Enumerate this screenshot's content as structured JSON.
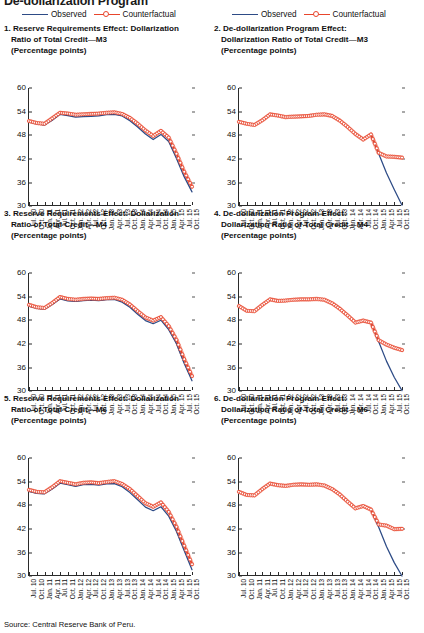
{
  "figure": {
    "heading": "De-dollarization Program",
    "source": "Source: Central Reserve Bank of Peru."
  },
  "legend": {
    "observed_label": "Observed",
    "counterfactual_label": "Counterfactual",
    "observed_color": "#2d4b86",
    "counterfactual_color": "#e8452c"
  },
  "panels": [
    {
      "number": "1.",
      "title_line1": "Reserve Requirements Effect: Dollarization",
      "title_line2": "Ratio of Total Credit—M3",
      "title_line3": "(Percentage points)"
    },
    {
      "number": "2.",
      "title_line1": "De-dollarization Program Effect:",
      "title_line2": "Dollarization Ratio of Total Credit—M3",
      "title_line3": "(Percentage points)"
    },
    {
      "number": "3.",
      "title_line1": "Reserve Requirements Effect: Dollarization",
      "title_line2": "Ratio of Total Credit—M4",
      "title_line3": "(Percentage points)"
    },
    {
      "number": "4.",
      "title_line1": "De-dollarization Program Effect:",
      "title_line2": "Dollarization Ratio of Total Credit—M4",
      "title_line3": "(Percentage points)"
    },
    {
      "number": "5.",
      "title_line1": "Reserve Requirements Effect: Dollarization",
      "title_line2": "Ratio of Total Credit—M6",
      "title_line3": "(Percentage points)"
    },
    {
      "number": "6.",
      "title_line1": "De-dollarization Program Effect:",
      "title_line2": "Dollarization Ratio of Total Credit—M6",
      "title_line3": "(Percentage points)"
    }
  ],
  "chart_data": [
    {
      "id": "panel-1",
      "type": "line",
      "title": "1. Reserve Requirements Effect: Dollarization Ratio of Total Credit—M3",
      "subtitle": "(Percentage points)",
      "xlabel": "",
      "ylabel": "Percentage points",
      "ylim": [
        30,
        60
      ],
      "yticks": [
        30,
        36,
        42,
        48,
        54,
        60
      ],
      "grid": false,
      "legend_position": "above-panel",
      "x": [
        "Jul. 10",
        "Oct. 10",
        "Jan. 11",
        "Apr. 11",
        "Jul. 11",
        "Oct. 11",
        "Jan. 12",
        "Apr. 12",
        "Jul. 12",
        "Oct. 12",
        "Jan. 13",
        "Apr. 13",
        "Jul. 13",
        "Oct. 13",
        "Jan. 14",
        "Apr. 14",
        "Jul. 14",
        "Oct. 14",
        "Jan. 15",
        "Apr. 15",
        "Jul. 15",
        "Oct. 15"
      ],
      "series": [
        {
          "name": "Observed",
          "color": "#2d4b86",
          "values": [
            51.4,
            50.9,
            50.6,
            51.8,
            53.3,
            53.0,
            52.6,
            52.7,
            52.8,
            52.9,
            53.2,
            53.3,
            52.9,
            51.7,
            50.1,
            48.3,
            46.9,
            48.2,
            46.4,
            42.1,
            37.4,
            33.6
          ]
        },
        {
          "name": "Counterfactual",
          "color": "#e8452c",
          "values": [
            51.6,
            51.1,
            50.9,
            52.3,
            53.7,
            53.5,
            53.2,
            53.3,
            53.4,
            53.5,
            53.7,
            53.8,
            53.4,
            52.4,
            50.9,
            49.2,
            47.8,
            49.1,
            47.4,
            43.3,
            38.7,
            34.9
          ]
        }
      ]
    },
    {
      "id": "panel-2",
      "type": "line",
      "title": "2. De-dollarization Program Effect: Dollarization Ratio of Total Credit—M3",
      "subtitle": "(Percentage points)",
      "xlabel": "",
      "ylabel": "Percentage points",
      "ylim": [
        30,
        60
      ],
      "yticks": [
        30,
        36,
        42,
        48,
        54,
        60
      ],
      "grid": false,
      "legend_position": "above-panel",
      "x": [
        "Jul. 10",
        "Oct. 10",
        "Jan. 11",
        "Apr. 11",
        "Jul. 11",
        "Oct. 11",
        "Jan. 12",
        "Apr. 12",
        "Jul. 12",
        "Oct. 12",
        "Jan. 13",
        "Apr. 13",
        "Jul. 13",
        "Oct. 13",
        "Jan. 14",
        "Apr. 14",
        "Jul. 14",
        "Oct. 14",
        "Jan. 15",
        "Apr. 15",
        "Jul. 15",
        "Oct. 15"
      ],
      "series": [
        {
          "name": "Observed",
          "color": "#2d4b86",
          "values": [
            51.4,
            50.9,
            50.6,
            51.8,
            53.3,
            53.0,
            52.6,
            52.7,
            52.8,
            52.9,
            53.2,
            53.3,
            52.9,
            51.7,
            50.1,
            48.3,
            46.9,
            48.2,
            43.3,
            38.4,
            34.2,
            30.2
          ]
        },
        {
          "name": "Counterfactual",
          "color": "#e8452c",
          "values": [
            51.4,
            50.9,
            50.6,
            51.8,
            53.3,
            53.0,
            52.6,
            52.7,
            52.8,
            52.9,
            53.2,
            53.3,
            52.9,
            51.7,
            50.1,
            48.3,
            46.9,
            48.2,
            43.5,
            42.6,
            42.5,
            42.3
          ]
        }
      ]
    },
    {
      "id": "panel-3",
      "type": "line",
      "title": "3. Reserve Requirements Effect: Dollarization Ratio of Total Credit—M4",
      "subtitle": "(Percentage points)",
      "xlabel": "",
      "ylabel": "Percentage points",
      "ylim": [
        30,
        60
      ],
      "yticks": [
        30,
        36,
        42,
        48,
        54,
        60
      ],
      "grid": false,
      "legend_position": "above-panel",
      "x": [
        "Jul. 10",
        "Oct. 10",
        "Jan. 11",
        "Apr. 11",
        "Jul. 11",
        "Oct. 11",
        "Jan. 12",
        "Apr. 12",
        "Jul. 12",
        "Oct. 12",
        "Jan. 13",
        "Apr. 13",
        "Jul. 13",
        "Oct. 13",
        "Jan. 14",
        "Apr. 14",
        "Jul. 14",
        "Oct. 14",
        "Jan. 15",
        "Apr. 15",
        "Jul. 15",
        "Oct. 15"
      ],
      "series": [
        {
          "name": "Observed",
          "color": "#2d4b86",
          "values": [
            51.6,
            51.0,
            50.8,
            52.0,
            53.4,
            52.9,
            52.8,
            53.0,
            53.1,
            53.0,
            53.2,
            53.3,
            52.6,
            51.3,
            49.5,
            47.9,
            47.1,
            48.0,
            45.6,
            42.0,
            37.0,
            32.6
          ]
        },
        {
          "name": "Counterfactual",
          "color": "#e8452c",
          "values": [
            51.9,
            51.3,
            51.1,
            52.4,
            53.9,
            53.4,
            53.2,
            53.4,
            53.5,
            53.4,
            53.6,
            53.7,
            53.2,
            52.0,
            50.3,
            48.7,
            47.9,
            48.8,
            46.5,
            43.0,
            38.1,
            33.8
          ]
        }
      ]
    },
    {
      "id": "panel-4",
      "type": "line",
      "title": "4. De-dollarization Program Effect: Dollarization Ratio of Total Credit—M4",
      "subtitle": "(Percentage points)",
      "xlabel": "",
      "ylabel": "Percentage points",
      "ylim": [
        30,
        60
      ],
      "yticks": [
        30,
        36,
        42,
        48,
        54,
        60
      ],
      "grid": false,
      "legend_position": "above-panel",
      "x": [
        "Jul. 10",
        "Oct. 10",
        "Jan. 11",
        "Apr. 11",
        "Jul. 11",
        "Oct. 11",
        "Jan. 12",
        "Apr. 12",
        "Jul. 12",
        "Oct. 12",
        "Jan. 13",
        "Apr. 13",
        "Jul. 13",
        "Oct. 13",
        "Jan. 14",
        "Apr. 14",
        "Jul. 14",
        "Oct. 14",
        "Jan. 15",
        "Apr. 15",
        "Jul. 15",
        "Oct. 15"
      ],
      "series": [
        {
          "name": "Observed",
          "color": "#2d4b86",
          "values": [
            51.6,
            50.4,
            50.3,
            51.9,
            53.3,
            52.9,
            53.0,
            53.2,
            53.3,
            53.3,
            53.4,
            53.2,
            52.3,
            50.9,
            49.2,
            47.4,
            47.9,
            47.4,
            42.5,
            37.6,
            33.5,
            30.1
          ]
        },
        {
          "name": "Counterfactual",
          "color": "#e8452c",
          "values": [
            51.6,
            50.4,
            50.3,
            51.9,
            53.3,
            52.9,
            53.0,
            53.2,
            53.3,
            53.3,
            53.4,
            53.2,
            52.3,
            50.9,
            49.2,
            47.4,
            47.9,
            47.4,
            42.9,
            41.8,
            41.0,
            40.4
          ]
        }
      ]
    },
    {
      "id": "panel-5",
      "type": "line",
      "title": "5. Reserve Requirements Effect: Dollarization Ratio of Total Credit—M6",
      "subtitle": "(Percentage points)",
      "xlabel": "",
      "ylabel": "Percentage points",
      "ylim": [
        30,
        60
      ],
      "yticks": [
        30,
        36,
        42,
        48,
        54,
        60
      ],
      "grid": false,
      "legend_position": "above-panel",
      "x": [
        "Jul. 10",
        "Oct. 10",
        "Jan. 11",
        "Apr. 11",
        "Jul. 11",
        "Oct. 11",
        "Jan. 12",
        "Apr. 12",
        "Jul. 12",
        "Oct. 12",
        "Jan. 13",
        "Apr. 13",
        "Jul. 13",
        "Oct. 13",
        "Jan. 14",
        "Apr. 14",
        "Jul. 14",
        "Oct. 14",
        "Jan. 15",
        "Apr. 15",
        "Jul. 15",
        "Oct. 15"
      ],
      "series": [
        {
          "name": "Observed",
          "color": "#2d4b86",
          "values": [
            51.5,
            51.0,
            50.9,
            52.1,
            53.6,
            53.2,
            52.8,
            53.2,
            53.3,
            53.1,
            53.4,
            53.5,
            52.7,
            51.2,
            49.4,
            47.5,
            46.6,
            47.6,
            45.2,
            41.3,
            36.4,
            31.6
          ]
        },
        {
          "name": "Counterfactual",
          "color": "#e8452c",
          "values": [
            51.9,
            51.4,
            51.3,
            52.6,
            54.1,
            53.7,
            53.3,
            53.7,
            53.8,
            53.6,
            53.9,
            54.1,
            53.4,
            52.1,
            50.3,
            48.5,
            47.6,
            48.7,
            46.3,
            42.5,
            37.7,
            33.0
          ]
        }
      ]
    },
    {
      "id": "panel-6",
      "type": "line",
      "title": "6. De-dollarization Program Effect: Dollarization Ratio of Total Credit—M6",
      "subtitle": "(Percentage points)",
      "xlabel": "",
      "ylabel": "Percentage points",
      "ylim": [
        30,
        60
      ],
      "yticks": [
        30,
        36,
        42,
        48,
        54,
        60
      ],
      "grid": false,
      "legend_position": "above-panel",
      "x": [
        "Jul. 10",
        "Oct. 10",
        "Jan. 11",
        "Apr. 11",
        "Jul. 11",
        "Oct. 11",
        "Jan. 12",
        "Apr. 12",
        "Jul. 12",
        "Oct. 12",
        "Jan. 13",
        "Apr. 13",
        "Jul. 13",
        "Oct. 13",
        "Jan. 14",
        "Apr. 14",
        "Jul. 14",
        "Oct. 14",
        "Jan. 15",
        "Apr. 15",
        "Jul. 15",
        "Oct. 15"
      ],
      "series": [
        {
          "name": "Observed",
          "color": "#2d4b86",
          "values": [
            51.4,
            50.6,
            50.5,
            52.1,
            53.5,
            53.1,
            52.9,
            53.2,
            53.3,
            53.2,
            53.3,
            53.0,
            52.1,
            50.7,
            48.9,
            47.2,
            47.8,
            46.9,
            42.4,
            37.5,
            33.4,
            30.0
          ]
        },
        {
          "name": "Counterfactual",
          "color": "#e8452c",
          "values": [
            51.4,
            50.6,
            50.5,
            52.1,
            53.5,
            53.1,
            52.9,
            53.2,
            53.3,
            53.2,
            53.3,
            53.0,
            52.1,
            50.7,
            48.9,
            47.2,
            47.8,
            46.9,
            43.1,
            42.8,
            41.9,
            42.0
          ]
        }
      ]
    }
  ]
}
